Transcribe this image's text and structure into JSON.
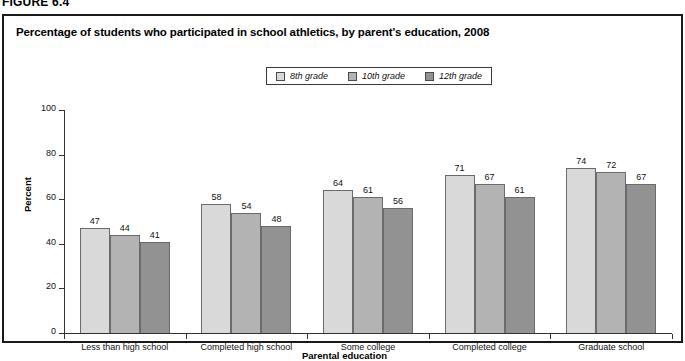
{
  "figure": {
    "label": "FIGURE 6.4",
    "title": "Percentage of students who participated in school athletics, by parent's education, 2008"
  },
  "chart_data": {
    "type": "bar",
    "title": "Percentage of students who participated in school athletics, by parent's education, 2008",
    "xlabel": "Parental education",
    "ylabel": "Percent",
    "ylim": [
      0,
      100
    ],
    "yticks": [
      0,
      20,
      40,
      60,
      80,
      100
    ],
    "grid": false,
    "legend_position": "top-center",
    "categories": [
      "Less than high school",
      "Completed high school",
      "Some college",
      "Completed college",
      "Graduate school"
    ],
    "series": [
      {
        "name": "8th grade",
        "color": "#d9d9d9",
        "values": [
          47,
          58,
          64,
          71,
          74
        ]
      },
      {
        "name": "10th grade",
        "color": "#b3b3b3",
        "values": [
          44,
          54,
          61,
          67,
          72
        ]
      },
      {
        "name": "12th grade",
        "color": "#929292",
        "values": [
          41,
          48,
          56,
          61,
          67
        ]
      }
    ]
  }
}
